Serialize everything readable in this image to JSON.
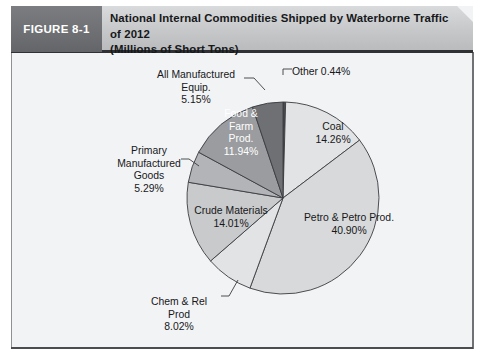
{
  "figure": {
    "tag_label": "FIGURE 8-1",
    "title_line1": "National Internal Commodities Shipped by Waterborne Traffic of 2012",
    "title_line2": "(Millions of Short Tons)"
  },
  "colors": {
    "tag_background": "#6d6f72",
    "header_background": "#c6c7c9",
    "panel_background": "#f2f3f5",
    "slice_outline": "#3a3c40",
    "text": "#16181a",
    "text_on_dark": "#ffffff"
  },
  "chart_data": {
    "type": "pie",
    "title": "National Internal Commodities Shipped by Waterborne Traffic of 2012",
    "subtitle": "(Millions of Short Tons)",
    "unit": "percent",
    "start_angle_deg": 0,
    "direction": "clockwise",
    "legend": "none",
    "labels_position": "slice-callouts",
    "categories": [
      "Other",
      "Coal",
      "Petro & Petro Prod.",
      "Chem & Rel Prod",
      "Crude Materials",
      "Primary Manufactured Goods",
      "Food & Farm Prod.",
      "All Manufactured Equip."
    ],
    "values": [
      0.44,
      14.26,
      40.9,
      8.02,
      14.01,
      5.29,
      11.94,
      5.15
    ],
    "slices": [
      {
        "name": "Other",
        "value": 0.44,
        "value_text": "0.44%",
        "label_text": "Other 0.44%",
        "fill": "#4a4c50",
        "label_placement": "outside-top",
        "label_lines": [
          "Other 0.44%"
        ]
      },
      {
        "name": "Coal",
        "value": 14.26,
        "value_text": "14.26%",
        "fill": "#e2e3e5",
        "label_placement": "inside",
        "label_lines": [
          "Coal",
          "14.26%"
        ]
      },
      {
        "name": "Petro & Petro Prod.",
        "value": 40.9,
        "value_text": "40.90%",
        "fill": "#d8d9db",
        "label_placement": "inside",
        "label_lines": [
          "Petro & Petro Prod.",
          "40.90%"
        ]
      },
      {
        "name": "Chem & Rel Prod",
        "value": 8.02,
        "value_text": "8.02%",
        "fill": "#e2e3e5",
        "label_placement": "outside-bottom-left",
        "label_lines": [
          "Chem & Rel",
          "Prod",
          "8.02%"
        ]
      },
      {
        "name": "Crude Materials",
        "value": 14.01,
        "value_text": "14.01%",
        "fill": "#c9cacc",
        "label_placement": "inside",
        "label_lines": [
          "Crude Materials",
          "14.01%"
        ]
      },
      {
        "name": "Primary Manufactured Goods",
        "value": 5.29,
        "value_text": "5.29%",
        "fill": "#b3b4b7",
        "label_placement": "outside-left",
        "label_lines": [
          "Primary",
          "Manufactured",
          "Goods",
          "5.29%"
        ]
      },
      {
        "name": "Food & Farm Prod.",
        "value": 11.94,
        "value_text": "11.94%",
        "fill": "#9a9c9f",
        "label_placement": "inside-dark",
        "label_lines": [
          "Food &",
          "Farm",
          "Prod.",
          "11.94%"
        ]
      },
      {
        "name": "All Manufactured Equip.",
        "value": 5.15,
        "value_text": "5.15%",
        "fill": "#6e7073",
        "label_placement": "outside-top-left",
        "label_lines": [
          "All Manufactured",
          "Equip.",
          "5.15%"
        ]
      }
    ]
  },
  "labels": {
    "other": "Other 0.44%",
    "all_manufactured_l1": "All Manufactured",
    "all_manufactured_l2": "Equip.",
    "all_manufactured_l3": "5.15%",
    "primary_l1": "Primary",
    "primary_l2": "Manufactured",
    "primary_l3": "Goods",
    "primary_l4": "5.29%",
    "chem_l1": "Chem & Rel",
    "chem_l2": "Prod",
    "chem_l3": "8.02%",
    "coal_l1": "Coal",
    "coal_l2": "14.26%",
    "petro_l1": "Petro & Petro Prod.",
    "petro_l2": "40.90%",
    "crude_l1": "Crude Materials",
    "crude_l2": "14.01%",
    "food_l1": "Food &",
    "food_l2": "Farm",
    "food_l3": "Prod.",
    "food_l4": "11.94%"
  }
}
